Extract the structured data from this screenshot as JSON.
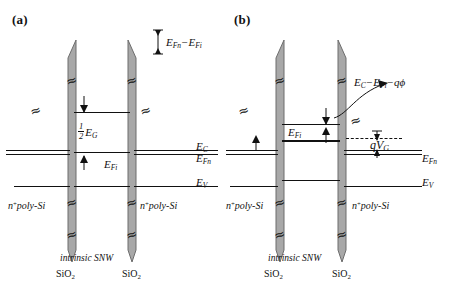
{
  "figure": {
    "type": "energy-band-diagram",
    "panels": [
      {
        "id": "a",
        "label": "(a)",
        "condition": "equilibrium, zero gate bias",
        "labels": {
          "fermi_split": "E_Fn − E_Fi",
          "half_gap": "½ E_G",
          "intrinsic_fermi": "E_Fi",
          "conduction_band": "E_C",
          "quasi_fermi": "E_Fn",
          "valence_band": "E_V",
          "contact_left": "n⁺poly-Si",
          "contact_right": "n⁺poly-Si",
          "channel": "intrinsic SNW",
          "oxide_left": "SiO₂",
          "oxide_right": "SiO₂"
        }
      },
      {
        "id": "b",
        "label": "(b)",
        "condition": "applied gate bias V_G, bands bent by qφ",
        "labels": {
          "barrier_height": "E_C − E_Fi − qφ",
          "intrinsic_fermi": "E_Fi",
          "gate_bias": "qV_G",
          "quasi_fermi": "E_Fn",
          "valence_band": "E_V",
          "contact_left": "n⁺poly-Si",
          "contact_right": "n⁺poly-Si",
          "channel": "intrinsic SNW",
          "oxide_left": "SiO₂",
          "oxide_right": "SiO₂"
        }
      }
    ],
    "symbols": {
      "break_symbol": "≈",
      "E": "E",
      "sub_C": "C",
      "sub_V": "V",
      "sub_Fn": "Fn",
      "sub_Fi": "Fi",
      "sub_G": "G",
      "q": "q",
      "phi": "φ",
      "V_G": "V",
      "superscript_plus": "+",
      "poly": "poly",
      "Si": "Si",
      "SiO2_base": "SiO",
      "SiO2_sub": "2",
      "intrinsic": "intrinsic",
      "SNW": "SNW",
      "half_num": "1",
      "half_den": "2"
    },
    "colors": {
      "oxide_fill": "#a8a8a8",
      "oxide_stroke": "#6d6d6d",
      "line": "#111111",
      "background": "#ffffff"
    }
  }
}
